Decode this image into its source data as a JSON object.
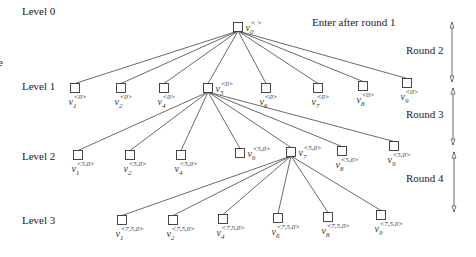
{
  "diagram": {
    "annotation": "Enter after round 1",
    "levels": [
      {
        "label": "Level 0",
        "y": 15
      },
      {
        "label": "Level 1",
        "y": 90
      },
      {
        "label": "Level 2",
        "y": 160
      },
      {
        "label": "Level 3",
        "y": 224
      }
    ],
    "rounds": [
      {
        "label": "Round 2",
        "y": 54,
        "top": 22,
        "bottom": 82
      },
      {
        "label": "Round 3",
        "y": 118,
        "top": 88,
        "bottom": 145
      },
      {
        "label": "Round 4",
        "y": 182,
        "top": 152,
        "bottom": 212
      }
    ],
    "root": {
      "x": 238,
      "y": 27,
      "name": "v",
      "sub": "0",
      "sup": "< >"
    },
    "level1": {
      "parent": [
        238,
        31
      ],
      "nodes": [
        {
          "x": 75,
          "y": 88,
          "sub": "1",
          "sup": "<0>",
          "label_pos": "below"
        },
        {
          "x": 121,
          "y": 88,
          "sub": "2",
          "sup": "<0>",
          "label_pos": "below"
        },
        {
          "x": 164,
          "y": 88,
          "sub": "4",
          "sup": "<0>",
          "label_pos": "below"
        },
        {
          "x": 208,
          "y": 88,
          "sub": "5",
          "sup": "<0>",
          "label_pos": "right"
        },
        {
          "x": 266,
          "y": 88,
          "sub": "6",
          "sup": "<0>",
          "label_pos": "below"
        },
        {
          "x": 318,
          "y": 88,
          "sub": "7",
          "sup": "<0>",
          "label_pos": "below"
        },
        {
          "x": 363,
          "y": 86,
          "sub": "8",
          "sup": "<0>",
          "label_pos": "below"
        },
        {
          "x": 407,
          "y": 83,
          "sub": "9",
          "sup": "<0>",
          "label_pos": "below"
        }
      ]
    },
    "level2": {
      "parent": [
        208,
        92
      ],
      "nodes": [
        {
          "x": 78,
          "y": 155,
          "sub": "1",
          "sup": "<5,0>",
          "label_pos": "below"
        },
        {
          "x": 130,
          "y": 155,
          "sub": "2",
          "sup": "<5,0>",
          "label_pos": "below"
        },
        {
          "x": 181,
          "y": 155,
          "sub": "4",
          "sup": "<5,0>",
          "label_pos": "below"
        },
        {
          "x": 240,
          "y": 153,
          "sub": "6",
          "sup": "<5,0>",
          "label_pos": "right"
        },
        {
          "x": 291,
          "y": 152,
          "sub": "7",
          "sup": "<5,0>",
          "label_pos": "right"
        },
        {
          "x": 342,
          "y": 151,
          "sub": "8",
          "sup": "<5,0>",
          "label_pos": "below"
        },
        {
          "x": 394,
          "y": 146,
          "sub": "9",
          "sup": "<5,0>",
          "label_pos": "below"
        }
      ]
    },
    "level3": {
      "parent": [
        291,
        156
      ],
      "nodes": [
        {
          "x": 122,
          "y": 220,
          "sub": "1",
          "sup": "<7,5,0>",
          "label_pos": "below"
        },
        {
          "x": 173,
          "y": 220,
          "sub": "2",
          "sup": "<7,5,0>",
          "label_pos": "below"
        },
        {
          "x": 223,
          "y": 219,
          "sub": "4",
          "sup": "<7,5,0>",
          "label_pos": "below"
        },
        {
          "x": 278,
          "y": 218,
          "sub": "6",
          "sup": "<7,5,0>",
          "label_pos": "below"
        },
        {
          "x": 328,
          "y": 217,
          "sub": "8",
          "sup": "<7,5,0>",
          "label_pos": "below"
        },
        {
          "x": 381,
          "y": 215,
          "sub": "9",
          "sup": "<7,5,0>",
          "label_pos": "below"
        }
      ]
    }
  }
}
